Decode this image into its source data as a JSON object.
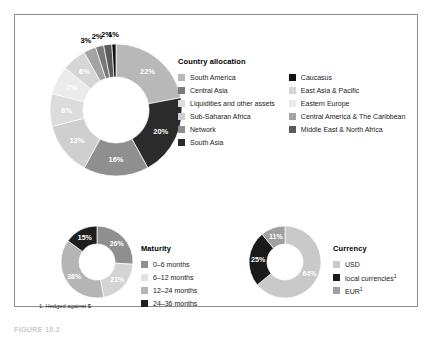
{
  "figure": {
    "footnote": "1. Hedged against $",
    "caption": "FIGURE 10.2"
  },
  "chart_data": [
    {
      "type": "pie",
      "variant": "donut",
      "id": "country-allocation",
      "title": "Country allocation",
      "legend_position": "right",
      "categories": [
        "South America",
        "South Asia",
        "Network",
        "Sub-Saharan Africa",
        "Liquidities and other assets",
        "Eastern Europe",
        "East Asia & Pacific",
        "Central America & The Caribbean",
        "Central Asia",
        "Middle East & North Africa",
        "Caucasus"
      ],
      "values": [
        22,
        20,
        16,
        13,
        8,
        7,
        6,
        3,
        2,
        2,
        1
      ],
      "value_labels": [
        "22%",
        "20%",
        "16%",
        "13%",
        "8%",
        "7%",
        "6%",
        "3%",
        "2%",
        "2%",
        "1%"
      ],
      "colors": [
        "#b8b8b8",
        "#2b2b2b",
        "#8f8f8f",
        "#cfcfcf",
        "#dcdcdc",
        "#ebebeb",
        "#d6d6d6",
        "#a3a3a3",
        "#7a7a7a",
        "#5b5b5b",
        "#111111"
      ],
      "legend": [
        {
          "label": "South America",
          "color": "#b8b8b8"
        },
        {
          "label": "Central Asia",
          "color": "#7a7a7a"
        },
        {
          "label": "Liquidities and other assets",
          "color": "#dcdcdc"
        },
        {
          "label": "Sub-Saharan Africa",
          "color": "#cfcfcf"
        },
        {
          "label": "Network",
          "color": "#8f8f8f"
        },
        {
          "label": "South Asia",
          "color": "#2b2b2b"
        },
        {
          "label": "Caucasus",
          "color": "#111111"
        },
        {
          "label": "East Asia & Pacific",
          "color": "#d6d6d6"
        },
        {
          "label": "Eastern Europe",
          "color": "#ebebeb"
        },
        {
          "label": "Central America & The Caribbean",
          "color": "#a3a3a3"
        },
        {
          "label": "Middle East & North Africa",
          "color": "#5b5b5b"
        }
      ]
    },
    {
      "type": "pie",
      "variant": "donut",
      "id": "maturity",
      "title": "Maturity",
      "legend_position": "right",
      "categories": [
        "0–6 months",
        "6–12 months",
        "12–24 months",
        "24–36 months"
      ],
      "values": [
        26,
        21,
        38,
        15
      ],
      "value_labels": [
        "26%",
        "21%",
        "38%",
        "15%"
      ],
      "colors": [
        "#8f8f8f",
        "#d4d4d4",
        "#b5b5b5",
        "#1f1f1f"
      ],
      "legend": [
        {
          "label": "0–6 months",
          "color": "#8f8f8f"
        },
        {
          "label": "6–12 months",
          "color": "#e2e2e2"
        },
        {
          "label": "12–24 months",
          "color": "#b5b5b5"
        },
        {
          "label": "24–36 months",
          "color": "#1f1f1f"
        }
      ]
    },
    {
      "type": "pie",
      "variant": "donut",
      "id": "currency",
      "title": "Currency",
      "legend_position": "right",
      "categories": [
        "USD",
        "local currencies",
        "EUR"
      ],
      "values": [
        64,
        25,
        11
      ],
      "value_labels": [
        "64%",
        "25%",
        "11%"
      ],
      "colors": [
        "#c9c9c9",
        "#1a1a1a",
        "#a0a0a0"
      ],
      "legend": [
        {
          "label": "USD",
          "sup": "",
          "color": "#c9c9c9"
        },
        {
          "label": "local currencies",
          "sup": "1",
          "color": "#1a1a1a"
        },
        {
          "label": "EUR",
          "sup": "1",
          "color": "#a0a0a0"
        }
      ]
    }
  ]
}
